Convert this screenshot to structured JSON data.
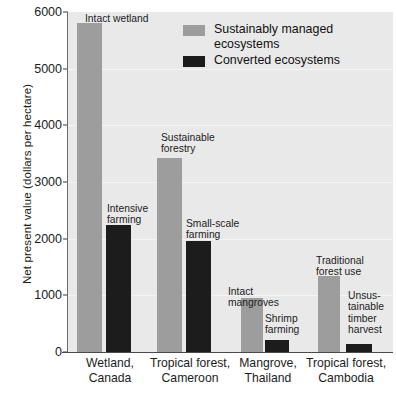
{
  "chart_data": {
    "type": "bar",
    "title": "",
    "xlabel": "",
    "ylabel": "Net present value (dollars per hectare)",
    "ylim": [
      0,
      6000
    ],
    "yticks": [
      0,
      1000,
      2000,
      3000,
      4000,
      5000,
      6000
    ],
    "ytick_labels": [
      "0",
      "1000",
      "2000",
      "3000",
      "4000",
      "5000",
      "6000"
    ],
    "grid": true,
    "legend_position": "top-center",
    "categories": [
      "Wetland,\nCanada",
      "Tropical forest,\nCameroon",
      "Mangrove,\nThailand",
      "Tropical forest,\nCambodia"
    ],
    "series": [
      {
        "name": "Sustainably managed ecosystems",
        "color": "#9d9d9d",
        "values": [
          5800,
          3420,
          950,
          1350
        ],
        "point_labels": [
          "Intact wetland",
          "Sustainable\nforestry",
          "Intact\nmangroves",
          "Traditional\nforest use"
        ]
      },
      {
        "name": "Converted ecosystems",
        "color": "#1c1c1c",
        "values": [
          2250,
          1960,
          210,
          150
        ],
        "point_labels": [
          "Intensive\nfarming",
          "Small-scale\nfarming",
          "Shrimp\nfarming",
          "Unsus-\ntainable\ntimber\nharvest"
        ]
      }
    ],
    "legend": [
      {
        "label": "Sustainably managed\necosystems",
        "swatch": "managed"
      },
      {
        "label": "Converted ecosystems",
        "swatch": "converted"
      }
    ]
  },
  "caption": ""
}
